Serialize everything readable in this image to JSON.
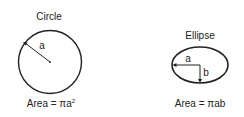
{
  "circle": {
    "title": "Circle",
    "radius_label": "a",
    "formula_prefix": "Area = πa",
    "formula_sup": "2"
  },
  "ellipse": {
    "title": "Ellipse",
    "semi_major_label": "a",
    "semi_minor_label": "b",
    "formula": "Area = πab"
  }
}
